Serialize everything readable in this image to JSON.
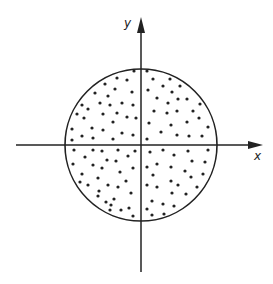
{
  "diagram": {
    "type": "scatter-in-circle",
    "axes": {
      "x_label": "x",
      "y_label": "y",
      "origin": [
        141,
        145
      ],
      "x_axis": {
        "from": 16,
        "to": 263
      },
      "y_axis": {
        "from": 17,
        "to": 272
      }
    },
    "circle": {
      "cx": 141,
      "cy": 145,
      "r": 76
    },
    "colors": {
      "ink": "#222222",
      "background": "#ffffff"
    },
    "points": [
      [
        134,
        71
      ],
      [
        117,
        78
      ],
      [
        127,
        80
      ],
      [
        105,
        84
      ],
      [
        115,
        89
      ],
      [
        95,
        93
      ],
      [
        108,
        96
      ],
      [
        132,
        92
      ],
      [
        100,
        103
      ],
      [
        110,
        105
      ],
      [
        122,
        103
      ],
      [
        133,
        105
      ],
      [
        82,
        105
      ],
      [
        88,
        109
      ],
      [
        77,
        114
      ],
      [
        84,
        118
      ],
      [
        103,
        114
      ],
      [
        117,
        113
      ],
      [
        127,
        117
      ],
      [
        136,
        118
      ],
      [
        113,
        122
      ],
      [
        72,
        129
      ],
      [
        92,
        128
      ],
      [
        103,
        130
      ],
      [
        122,
        133
      ],
      [
        133,
        135
      ],
      [
        72,
        140
      ],
      [
        82,
        136
      ],
      [
        93,
        138
      ],
      [
        113,
        139
      ],
      [
        147,
        71
      ],
      [
        153,
        79
      ],
      [
        170,
        79
      ],
      [
        163,
        86
      ],
      [
        180,
        86
      ],
      [
        148,
        90
      ],
      [
        172,
        92
      ],
      [
        157,
        98
      ],
      [
        178,
        99
      ],
      [
        187,
        99
      ],
      [
        168,
        103
      ],
      [
        200,
        104
      ],
      [
        154,
        111
      ],
      [
        167,
        113
      ],
      [
        177,
        111
      ],
      [
        193,
        111
      ],
      [
        199,
        118
      ],
      [
        187,
        122
      ],
      [
        149,
        123
      ],
      [
        171,
        125
      ],
      [
        208,
        127
      ],
      [
        161,
        132
      ],
      [
        177,
        135
      ],
      [
        189,
        136
      ],
      [
        202,
        136
      ],
      [
        147,
        139
      ],
      [
        74,
        150
      ],
      [
        93,
        150
      ],
      [
        102,
        151
      ],
      [
        118,
        150
      ],
      [
        135,
        151
      ],
      [
        85,
        157
      ],
      [
        107,
        160
      ],
      [
        116,
        161
      ],
      [
        128,
        156
      ],
      [
        73,
        164
      ],
      [
        93,
        165
      ],
      [
        102,
        168
      ],
      [
        133,
        168
      ],
      [
        120,
        172
      ],
      [
        82,
        174
      ],
      [
        98,
        178
      ],
      [
        126,
        181
      ],
      [
        80,
        182
      ],
      [
        88,
        185
      ],
      [
        108,
        185
      ],
      [
        118,
        187
      ],
      [
        99,
        191
      ],
      [
        131,
        193
      ],
      [
        98,
        196
      ],
      [
        114,
        199
      ],
      [
        106,
        202
      ],
      [
        111,
        205
      ],
      [
        129,
        208
      ],
      [
        110,
        210
      ],
      [
        121,
        210
      ],
      [
        133,
        216
      ],
      [
        150,
        152
      ],
      [
        163,
        150
      ],
      [
        174,
        155
      ],
      [
        188,
        151
      ],
      [
        208,
        150
      ],
      [
        192,
        161
      ],
      [
        205,
        162
      ],
      [
        147,
        167
      ],
      [
        157,
        164
      ],
      [
        171,
        167
      ],
      [
        185,
        171
      ],
      [
        153,
        175
      ],
      [
        191,
        177
      ],
      [
        203,
        174
      ],
      [
        147,
        185
      ],
      [
        157,
        187
      ],
      [
        171,
        181
      ],
      [
        178,
        185
      ],
      [
        197,
        187
      ],
      [
        172,
        193
      ],
      [
        186,
        194
      ],
      [
        152,
        201
      ],
      [
        163,
        204
      ],
      [
        174,
        206
      ],
      [
        147,
        209
      ],
      [
        152,
        215
      ],
      [
        164,
        214
      ]
    ]
  }
}
